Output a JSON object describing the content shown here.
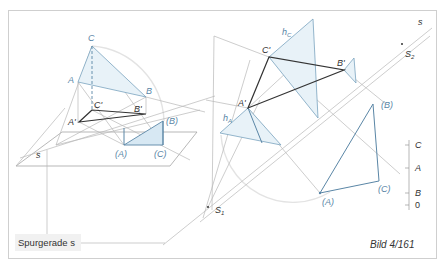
{
  "figure": {
    "caption": "Bild 4/161",
    "legend_label": "Spurgerade s",
    "colors": {
      "accent_blue": "#5a86a6",
      "fill_blue": "#d7e8f3",
      "ink_dark": "#333333",
      "construction_gray": "#b8b8b8",
      "frame": "#cfcfcf"
    }
  },
  "left_view": {
    "labels": {
      "C": "C",
      "A": "A",
      "B": "B",
      "C_prime": "C'",
      "B_prime": "B'",
      "A_prime": "A'",
      "B_rot": "(B)",
      "A_rot": "(A)",
      "C_rot": "(C)",
      "s": "s"
    }
  },
  "right_view": {
    "labels": {
      "C_prime": "C'",
      "B_prime": "B'",
      "A_prime": "A'",
      "h_C": "h",
      "h_C_sub": "C",
      "h_A": "h",
      "h_A_sub": "A",
      "B_rot": "(B)",
      "A_rot": "(A)",
      "C_rot": "(C)",
      "s": "s",
      "S1": "S",
      "S1_sub": "1",
      "S2": "S",
      "S2_sub": "2"
    }
  },
  "height_scale": {
    "ticks": [
      {
        "label": "C"
      },
      {
        "label": "A"
      },
      {
        "label": "B"
      },
      {
        "label": "0"
      }
    ]
  }
}
